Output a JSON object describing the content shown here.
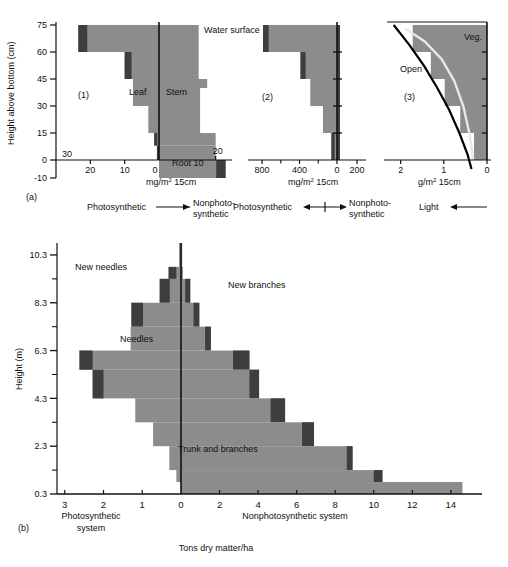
{
  "figure": {
    "panel_a_label": "(a)",
    "panel_b_label": "(b)"
  },
  "chart_data": [
    {
      "id": "panel-a1",
      "type": "bar",
      "orientation": "horizontal-diverging",
      "panel_tag": "(1)",
      "title": "",
      "ylabel": "Height above bottom (cm)",
      "xlabel": "mg/m2 15cm",
      "xlabel_display": "mg/m² 15cm",
      "annotation_water_surface": "Water surface",
      "label_left": "Leaf",
      "label_right": "Stem",
      "label_root": "Root 10",
      "y_ticks": [
        75,
        60,
        45,
        30,
        15,
        0,
        -10
      ],
      "y_tick_labels": [
        "75",
        "60",
        "45",
        "30",
        "15",
        "0",
        "-10"
      ],
      "ylim": [
        -10,
        75
      ],
      "x_left_ticks": [
        30,
        20,
        10,
        0
      ],
      "x_left_tick_labels": [
        "30",
        "20",
        "10",
        "0"
      ],
      "x_right_ticks": [
        20
      ],
      "x_right_tick_labels": [
        "20"
      ],
      "xlim_left": 30,
      "xlim_right": 24,
      "bands": [
        {
          "y0": 60,
          "y1": 75,
          "left": 23.5,
          "right": 14.0,
          "cap_left": 2.6,
          "cap_right": 0
        },
        {
          "y0": 45,
          "y1": 60,
          "left": 10.0,
          "right": 14.0,
          "cap_left": 2.0,
          "cap_right": 0
        },
        {
          "y0": 40,
          "y1": 45,
          "left": 7.6,
          "right": 17.0,
          "cap_left": 0,
          "cap_right": 0
        },
        {
          "y0": 30,
          "y1": 40,
          "left": 7.6,
          "right": 14.5,
          "cap_left": 0,
          "cap_right": 0
        },
        {
          "y0": 15,
          "y1": 30,
          "left": 3.1,
          "right": 14.5,
          "cap_left": 0,
          "cap_right": 0
        },
        {
          "y0": 8,
          "y1": 15,
          "left": 1.4,
          "right": 20.0,
          "cap_left": 0.9,
          "cap_right": 0
        },
        {
          "y0": 0,
          "y1": 8,
          "left": 0.6,
          "right": 20.0,
          "cap_left": 0.6,
          "cap_right": 0
        },
        {
          "y0": -10,
          "y1": 0,
          "left": 0,
          "right": 23.5,
          "cap_left": 0,
          "cap_right": 3.3
        }
      ]
    },
    {
      "id": "panel-a2",
      "type": "bar",
      "orientation": "horizontal-diverging",
      "panel_tag": "(2)",
      "xlabel": "mg/m2 15cm",
      "xlabel_display": "mg/m² 15cm",
      "x_left_ticks": [
        800,
        400,
        0
      ],
      "x_left_tick_labels": [
        "800",
        "400",
        "0"
      ],
      "x_right_ticks": [
        200
      ],
      "x_right_tick_labels": [
        "200"
      ],
      "xlim_left": 950,
      "xlim_right": 250,
      "ylim": [
        -10,
        75
      ],
      "bands": [
        {
          "y0": 60,
          "y1": 75,
          "left": 790,
          "right": 30,
          "cap_left": 60,
          "cap_right": 0
        },
        {
          "y0": 45,
          "y1": 60,
          "left": 390,
          "right": 30,
          "cap_left": 55,
          "cap_right": 0
        },
        {
          "y0": 30,
          "y1": 45,
          "left": 285,
          "right": 30,
          "cap_left": 0,
          "cap_right": 0
        },
        {
          "y0": 15,
          "y1": 30,
          "left": 150,
          "right": 30,
          "cap_left": 0,
          "cap_right": 0
        },
        {
          "y0": 0,
          "y1": 15,
          "left": 60,
          "right": 30,
          "cap_left": 35,
          "cap_right": 0
        }
      ]
    },
    {
      "id": "panel-a3",
      "type": "area",
      "panel_tag": "(3)",
      "xlabel": "g/m2 15cm",
      "xlabel_display": "g/m² 15cm",
      "label_open_curve": "Open",
      "label_veg_curve": "Veg.",
      "x_ticks": [
        2,
        1,
        0
      ],
      "x_tick_labels": [
        "2",
        "1",
        "0"
      ],
      "xlim": [
        2.2,
        0
      ],
      "x_reversed": true,
      "ylim": [
        -10,
        75
      ],
      "steps": [
        {
          "y0": 60,
          "y1": 75,
          "x": 1.72
        },
        {
          "y0": 45,
          "y1": 60,
          "x": 1.3
        },
        {
          "y0": 30,
          "y1": 45,
          "x": 0.98
        },
        {
          "y0": 15,
          "y1": 30,
          "x": 0.62
        },
        {
          "y0": 0,
          "y1": 15,
          "x": 0.3
        }
      ],
      "open_curve": [
        {
          "x": 2.16,
          "y": 75
        },
        {
          "x": 1.8,
          "y": 64
        },
        {
          "x": 1.45,
          "y": 52
        },
        {
          "x": 1.15,
          "y": 40
        },
        {
          "x": 0.88,
          "y": 28
        },
        {
          "x": 0.64,
          "y": 15
        },
        {
          "x": 0.45,
          "y": 3
        },
        {
          "x": 0.36,
          "y": -5
        }
      ],
      "veg_curve": [
        {
          "x": 1.9,
          "y": 73
        },
        {
          "x": 1.45,
          "y": 66
        },
        {
          "x": 1.05,
          "y": 56
        },
        {
          "x": 0.76,
          "y": 44
        },
        {
          "x": 0.55,
          "y": 30
        },
        {
          "x": 0.4,
          "y": 14
        },
        {
          "x": 0.32,
          "y": 0
        }
      ]
    },
    {
      "id": "panel-b",
      "type": "bar",
      "orientation": "horizontal-diverging",
      "ylabel": "Height (m)",
      "xlabel": "Tons dry matter/ha",
      "label_left_axis": "Photosynthetic system",
      "label_left_axis_line1": "Photosynthetic",
      "label_left_axis_line2": "system",
      "label_right_axis": "Nonphotosynthetic system",
      "annotations": [
        "New needles",
        "Needles",
        "New branches",
        "Trunk and branches"
      ],
      "label_new_needles": "New needles",
      "label_needles": "Needles",
      "label_new_branches": "New branches",
      "label_trunk": "Trunk and branches",
      "y_major_ticks": [
        0.3,
        2.3,
        4.3,
        6.3,
        8.3,
        10.3
      ],
      "y_major_tick_labels": [
        "0.3",
        "2.3",
        "4.3",
        "6.3",
        "8.3",
        "10.3"
      ],
      "y_minor_ticks": [
        1.3,
        3.3,
        5.3,
        7.3,
        9.3
      ],
      "ylim": [
        0.3,
        10.8
      ],
      "x_left_ticks": [
        3,
        2,
        1,
        0
      ],
      "x_left_tick_labels": [
        "3",
        "2",
        "1",
        "0"
      ],
      "x_right_ticks": [
        0,
        2,
        4,
        6,
        8,
        10,
        12,
        14
      ],
      "x_right_tick_labels": [
        "0",
        "2",
        "4",
        "6",
        "8",
        "10",
        "12",
        "14"
      ],
      "xlim_left": 3.2,
      "xlim_right": 15.2,
      "bands": [
        {
          "y0": 9.8,
          "y1": 10.8,
          "left": 0.05,
          "right": 0.06,
          "cap_left": 0,
          "cap_right": 0
        },
        {
          "y0": 9.3,
          "y1": 9.8,
          "left": 0.32,
          "right": 0.1,
          "cap_left": 0.2,
          "cap_right": 0
        },
        {
          "y0": 8.3,
          "y1": 9.3,
          "left": 0.55,
          "right": 0.48,
          "cap_left": 0.26,
          "cap_right": 0.26
        },
        {
          "y0": 7.3,
          "y1": 8.3,
          "left": 1.28,
          "right": 0.95,
          "cap_left": 0.3,
          "cap_right": 0.3
        },
        {
          "y0": 6.3,
          "y1": 7.3,
          "left": 1.3,
          "right": 1.55,
          "cap_left": 0,
          "cap_right": 0.3
        },
        {
          "y0": 5.5,
          "y1": 6.3,
          "left": 2.62,
          "right": 3.55,
          "cap_left": 0.34,
          "cap_right": 0.85
        },
        {
          "y0": 4.3,
          "y1": 5.5,
          "left": 2.28,
          "right": 4.05,
          "cap_left": 0.28,
          "cap_right": 0.5
        },
        {
          "y0": 3.3,
          "y1": 4.3,
          "left": 1.18,
          "right": 5.4,
          "cap_left": 0,
          "cap_right": 0.75
        },
        {
          "y0": 2.3,
          "y1": 3.3,
          "left": 0.72,
          "right": 6.9,
          "cap_left": 0,
          "cap_right": 0.62
        },
        {
          "y0": 1.3,
          "y1": 2.3,
          "left": 0.3,
          "right": 8.9,
          "cap_left": 0,
          "cap_right": 0.3
        },
        {
          "y0": 0.8,
          "y1": 1.3,
          "left": 0.12,
          "right": 10.45,
          "cap_left": 0,
          "cap_right": 0.45
        },
        {
          "y0": 0.3,
          "y1": 0.8,
          "left": 0.0,
          "right": 14.6,
          "cap_left": 0,
          "cap_right": 0
        }
      ]
    }
  ],
  "arrows": {
    "a1_left_text": "Photosynthetic",
    "a1_right_text_line1": "Nonphoto-",
    "a1_right_text_line2": "synthetic",
    "a2_left_text": "Photosynthetic",
    "a2_right_text_line1": "Nonphoto-",
    "a2_right_text_line2": "synthetic",
    "a3_text": "Light"
  },
  "colors": {
    "fill_light": "#8c8c8c",
    "fill_dark": "#3e3e3e",
    "axis": "#111111",
    "open_curve": "#000000",
    "veg_curve": "#e8e8e8",
    "background": "#ffffff"
  }
}
